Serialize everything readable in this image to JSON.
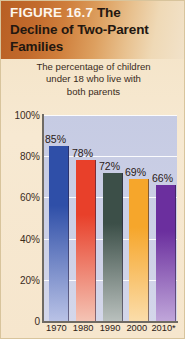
{
  "figure": {
    "label": "FIGURE 16.7",
    "title_line1_rest": " The",
    "title_line2": "Decline of Two-Parent",
    "title_line3": "Families",
    "subtitle_line1": "The percentage of children",
    "subtitle_line2": "under 18 who live with",
    "subtitle_line3": "both parents"
  },
  "colors": {
    "header_start": "#b85f24",
    "header_end": "#f2e3cb",
    "card_background": "#f6e6cd",
    "plot_background": "#ccd0e6",
    "gridline": "#ffffff",
    "axis": "#6f6a63",
    "text": "#2b2016"
  },
  "chart_data": {
    "type": "bar",
    "title": "Decline of Two-Parent Families",
    "subtitle": "The percentage of children under 18 who live with both parents",
    "xlabel": "",
    "ylabel": "",
    "categories": [
      "1970",
      "1980",
      "1990",
      "2000",
      "2010*"
    ],
    "values": [
      85,
      78,
      72,
      69,
      66
    ],
    "value_labels": [
      "85%",
      "78%",
      "72%",
      "69%",
      "66%"
    ],
    "ylim": [
      0,
      100
    ],
    "yticks": [
      100,
      80,
      60,
      40,
      20,
      0
    ],
    "ytick_labels": [
      "100%",
      "80%",
      "60%",
      "40%",
      "20%",
      "0"
    ],
    "grid": true,
    "legend": false,
    "bar_colors": [
      "#2f4fa8",
      "#e8402a",
      "#3c4f48",
      "#f6a62b",
      "#6b2f9e"
    ],
    "bar_colors_bottom": [
      "#b9c2e6",
      "#f4c3b4",
      "#b9c0bd",
      "#fbddaa",
      "#c0a6da"
    ],
    "note": "2010 value marked with asterisk"
  }
}
